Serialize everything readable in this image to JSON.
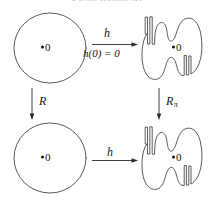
{
  "figure": {
    "caption_fragment": "a cross-section; see",
    "background_color": "#ffffff",
    "stroke_color": "#3d3d3d"
  },
  "nodes": {
    "top_left": {
      "shape": "circle",
      "point_label": "0"
    },
    "top_right": {
      "shape": "amoeba-blob",
      "point_label": "0"
    },
    "bottom_left": {
      "shape": "circle",
      "point_label": "0"
    },
    "bottom_right": {
      "shape": "amoeba-blob",
      "point_label": "0"
    }
  },
  "arrows": {
    "top": {
      "direction": "right",
      "label_above": "h",
      "label_below": "h(0) = 0"
    },
    "bottom": {
      "direction": "right",
      "label_above": "h"
    },
    "left": {
      "direction": "down",
      "label": "R"
    },
    "right": {
      "direction": "down",
      "label": "R",
      "label_subscript": "π"
    }
  }
}
